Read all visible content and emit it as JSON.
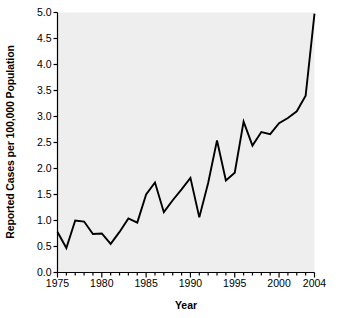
{
  "chart_data": {
    "type": "line",
    "title": "",
    "xlabel": "Year",
    "ylabel": "Reported Cases per 100,000 Population",
    "xlim": [
      1975,
      2004
    ],
    "ylim": [
      0.0,
      5.0
    ],
    "grid": false,
    "legend": false,
    "series_color": "#000000",
    "plot_background": "#eeeeee",
    "x": [
      1975,
      1976,
      1977,
      1978,
      1979,
      1980,
      1981,
      1982,
      1983,
      1984,
      1985,
      1986,
      1987,
      1988,
      1989,
      1990,
      1991,
      1992,
      1993,
      1994,
      1995,
      1996,
      1997,
      1998,
      1999,
      2000,
      2001,
      2002,
      2003,
      2004
    ],
    "values": [
      0.78,
      0.47,
      1.0,
      0.98,
      0.74,
      0.75,
      0.55,
      0.78,
      1.04,
      0.96,
      1.5,
      1.73,
      1.16,
      1.39,
      1.6,
      1.82,
      1.06,
      1.72,
      2.54,
      1.77,
      1.92,
      2.9,
      2.44,
      2.7,
      2.66,
      2.87,
      2.97,
      3.1,
      3.4,
      4.98
    ],
    "xticks": [
      1975,
      1980,
      1985,
      1990,
      1995,
      2000,
      2004
    ],
    "xtick_labels": [
      "1975",
      "1980",
      "1985",
      "1990",
      "1995",
      "2000",
      "2004"
    ],
    "yticks": [
      0.0,
      0.5,
      1.0,
      1.5,
      2.0,
      2.5,
      3.0,
      3.5,
      4.0,
      4.5,
      5.0
    ],
    "ytick_labels": [
      "0.0",
      "0.5",
      "1.0",
      "1.5",
      "2.0",
      "2.5",
      "3.0",
      "3.5",
      "4.0",
      "4.5",
      "5.0"
    ],
    "minor_xticks_every": 1
  }
}
